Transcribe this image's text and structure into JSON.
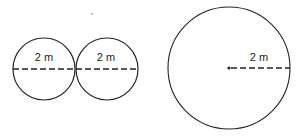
{
  "diagram": {
    "small_circles": [
      {
        "label": "2 m",
        "measure": "diameter"
      },
      {
        "label": "2 m",
        "measure": "diameter"
      }
    ],
    "large_circle": {
      "label": "2 m",
      "measure": "radius"
    },
    "colors": {
      "stroke": "#222222",
      "background": "#ffffff"
    }
  }
}
